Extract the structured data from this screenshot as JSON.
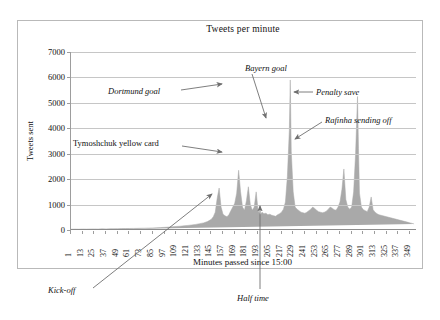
{
  "chart_data": {
    "type": "area",
    "title": "Tweets per minute",
    "xlabel": "Minutes passed since 15:00",
    "ylabel": "Tweets sent",
    "ylim": [
      0,
      7000
    ],
    "ytick_labels": [
      "0",
      "1000",
      "2000",
      "3000",
      "4000",
      "5000",
      "6000",
      "7000"
    ],
    "ytick_values": [
      0,
      1000,
      2000,
      3000,
      4000,
      5000,
      6000,
      7000
    ],
    "xlim": [
      1,
      355
    ],
    "xtick_labels": [
      "1",
      "13",
      "25",
      "37",
      "49",
      "61",
      "73",
      "85",
      "97",
      "109",
      "121",
      "133",
      "145",
      "157",
      "169",
      "181",
      "193",
      "205",
      "217",
      "229",
      "241",
      "253",
      "265",
      "277",
      "289",
      "301",
      "313",
      "325",
      "337",
      "349"
    ],
    "xtick_values": [
      1,
      13,
      25,
      37,
      49,
      61,
      73,
      85,
      97,
      109,
      121,
      133,
      145,
      157,
      169,
      181,
      193,
      205,
      217,
      229,
      241,
      253,
      265,
      277,
      289,
      301,
      313,
      325,
      337,
      349
    ],
    "grid": true,
    "legend": "none",
    "series_color": "#a9a9a9",
    "series_name": "Tweets sent",
    "x": [
      1,
      5,
      9,
      13,
      17,
      21,
      25,
      29,
      33,
      37,
      41,
      45,
      49,
      53,
      57,
      61,
      65,
      69,
      73,
      77,
      81,
      85,
      89,
      93,
      97,
      101,
      105,
      109,
      113,
      117,
      121,
      125,
      129,
      133,
      137,
      141,
      145,
      147,
      149,
      151,
      153,
      155,
      157,
      159,
      161,
      163,
      165,
      167,
      169,
      171,
      173,
      175,
      177,
      179,
      181,
      183,
      185,
      187,
      189,
      191,
      193,
      195,
      197,
      199,
      201,
      203,
      205,
      207,
      209,
      211,
      213,
      215,
      217,
      219,
      221,
      223,
      225,
      226,
      227,
      229,
      231,
      233,
      235,
      237,
      239,
      241,
      243,
      245,
      247,
      249,
      251,
      253,
      255,
      257,
      259,
      261,
      263,
      265,
      267,
      269,
      271,
      273,
      275,
      277,
      279,
      281,
      283,
      285,
      287,
      289,
      291,
      293,
      295,
      296,
      297,
      299,
      301,
      303,
      305,
      307,
      309,
      311,
      313,
      315,
      317,
      319,
      321,
      323,
      325,
      327,
      329,
      331,
      333,
      335,
      337,
      339,
      341,
      343,
      345,
      347,
      349,
      351,
      353,
      355
    ],
    "y": [
      30,
      35,
      32,
      38,
      35,
      40,
      42,
      38,
      45,
      44,
      48,
      50,
      52,
      55,
      58,
      60,
      62,
      65,
      70,
      72,
      78,
      82,
      90,
      95,
      105,
      115,
      125,
      140,
      150,
      165,
      180,
      200,
      220,
      250,
      280,
      330,
      420,
      520,
      700,
      1250,
      1650,
      900,
      620,
      560,
      520,
      600,
      760,
      900,
      1050,
      1450,
      2350,
      1500,
      900,
      780,
      1150,
      1700,
      1000,
      780,
      900,
      1500,
      760,
      600,
      700,
      640,
      660,
      600,
      620,
      580,
      560,
      540,
      600,
      640,
      700,
      820,
      1100,
      2100,
      3900,
      5900,
      3100,
      1500,
      900,
      820,
      760,
      700,
      680,
      660,
      700,
      760,
      820,
      900,
      850,
      780,
      720,
      700,
      680,
      700,
      740,
      820,
      900,
      860,
      800,
      780,
      900,
      1100,
      1600,
      2400,
      1200,
      900,
      820,
      900,
      1500,
      3000,
      5250,
      3200,
      1450,
      900,
      800,
      760,
      720,
      900,
      1300,
      800,
      700,
      640,
      600,
      580,
      560,
      540,
      520,
      500,
      480,
      460,
      440,
      420,
      400,
      380,
      360,
      340,
      320,
      300,
      280,
      260,
      240
    ],
    "annotations": [
      {
        "label": "Dortmund goal",
        "target_x": 226,
        "target_y": 5900
      },
      {
        "label": "Bayern goal",
        "target_x": 241,
        "target_y": 3900
      },
      {
        "label": "Penalty save",
        "target_x": 296,
        "target_y": 5250
      },
      {
        "label": "Rafinha sending off",
        "target_x": 296,
        "target_y": 3800
      },
      {
        "label": "Tymoshchuk yellow card",
        "target_x": 226,
        "target_y": 2900
      },
      {
        "label": "Kick-off",
        "target_x": 145,
        "target_y": 1600
      },
      {
        "label": "Half time",
        "target_x": 205,
        "target_y": 950
      }
    ]
  },
  "annotations": {
    "dortmund_goal": "Dortmund goal",
    "bayern_goal": "Bayern goal",
    "penalty_save": "Penalty save",
    "rafinha_sending_off": "Rafinha sending off",
    "tymoshchuk_yellow_card": "Tymoshchuk yellow card",
    "kick_off": "Kick-off",
    "half_time": "Half time"
  },
  "axes": {
    "title": "Tweets per minute",
    "x_title": "Minutes passed since 15:00",
    "y_title": "Tweets sent"
  }
}
